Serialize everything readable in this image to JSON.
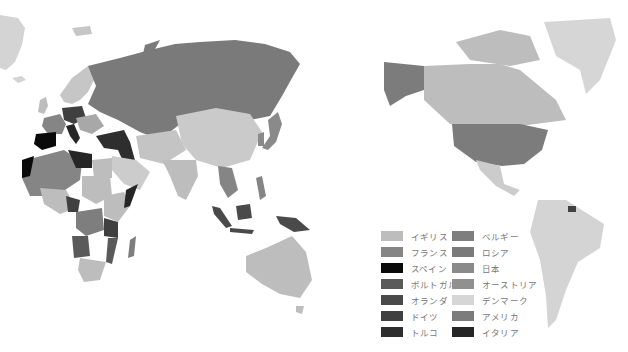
{
  "map": {
    "type": "choropleth",
    "projection": "pacific-centered world map",
    "background": "#ffffff",
    "land_default": "#d4d4d4"
  },
  "legend": {
    "columns": [
      [
        {
          "label": "イギリス",
          "color": "#bdbdbd"
        },
        {
          "label": "フランス",
          "color": "#858585"
        },
        {
          "label": "スペイン",
          "color": "#0a0a0a"
        },
        {
          "label": "ポルトガル",
          "color": "#5a5a5a"
        },
        {
          "label": "オランダ",
          "color": "#4a4a4a"
        },
        {
          "label": "ドイツ",
          "color": "#404040"
        },
        {
          "label": "トルコ",
          "color": "#2e2e2e"
        }
      ],
      [
        {
          "label": "ベルギー",
          "color": "#7e7e7e"
        },
        {
          "label": "ロシア",
          "color": "#7a7a7a"
        },
        {
          "label": "日本",
          "color": "#8a8a8a"
        },
        {
          "label": "オーストリア",
          "color": "#909090"
        },
        {
          "label": "デンマーク",
          "color": "#d6d6d6"
        },
        {
          "label": "アメリカ",
          "color": "#7c7c7c"
        },
        {
          "label": "イタリア",
          "color": "#262626"
        }
      ]
    ]
  }
}
